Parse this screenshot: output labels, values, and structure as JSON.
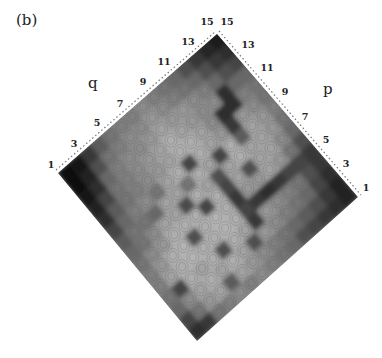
{
  "panel_label": "(b)",
  "chart_data": {
    "type": "heatmap",
    "title": "",
    "panel": "(b)",
    "orientation": "rotated 45 degrees (diamond)",
    "xlabel": "q",
    "ylabel": "p",
    "q_ticks": [
      "1",
      "3",
      "5",
      "7",
      "9",
      "11",
      "13",
      "15"
    ],
    "p_ticks": [
      "1",
      "3",
      "5",
      "7",
      "9",
      "11",
      "13",
      "15"
    ],
    "q_range": [
      1,
      15
    ],
    "p_range": [
      1,
      15
    ],
    "colormap": "grayscale (dark = high)",
    "grid": false,
    "legend": "none",
    "rows_are_p_from_1_to_15_columns_are_q_from_1_to_15": true,
    "values": [
      [
        0.85,
        0.8,
        0.55,
        0.5,
        0.45,
        0.5,
        0.45,
        0.5,
        0.55,
        0.6,
        0.7,
        0.75,
        0.8,
        0.85,
        0.9
      ],
      [
        0.75,
        0.55,
        0.4,
        0.35,
        0.65,
        0.35,
        0.4,
        0.45,
        0.5,
        0.55,
        0.6,
        0.65,
        0.7,
        0.8,
        0.9
      ],
      [
        0.6,
        0.45,
        0.35,
        0.3,
        0.35,
        0.3,
        0.35,
        0.7,
        0.4,
        0.45,
        0.5,
        0.55,
        0.6,
        0.75,
        0.85
      ],
      [
        0.55,
        0.75,
        0.3,
        0.35,
        0.3,
        0.7,
        0.3,
        0.35,
        0.8,
        0.4,
        0.45,
        0.5,
        0.55,
        0.7,
        0.8
      ],
      [
        0.5,
        0.35,
        0.3,
        0.28,
        0.3,
        0.3,
        0.28,
        0.3,
        0.75,
        0.8,
        0.85,
        0.8,
        0.75,
        0.75,
        0.8
      ],
      [
        0.5,
        0.4,
        0.3,
        0.28,
        0.7,
        0.3,
        0.28,
        0.3,
        0.8,
        0.4,
        0.4,
        0.35,
        0.4,
        0.55,
        0.7
      ],
      [
        0.55,
        0.45,
        0.4,
        0.3,
        0.3,
        0.3,
        0.75,
        0.3,
        0.75,
        0.35,
        0.7,
        0.35,
        0.35,
        0.45,
        0.6
      ],
      [
        0.6,
        0.55,
        0.45,
        0.35,
        0.35,
        0.72,
        0.3,
        0.35,
        0.7,
        0.35,
        0.3,
        0.35,
        0.35,
        0.4,
        0.55
      ],
      [
        0.65,
        0.55,
        0.55,
        0.6,
        0.35,
        0.35,
        0.55,
        0.3,
        0.35,
        0.75,
        0.3,
        0.65,
        0.35,
        0.4,
        0.5
      ],
      [
        0.75,
        0.6,
        0.5,
        0.45,
        0.55,
        0.35,
        0.3,
        0.75,
        0.3,
        0.35,
        0.4,
        0.8,
        0.4,
        0.45,
        0.55
      ],
      [
        0.85,
        0.65,
        0.55,
        0.5,
        0.45,
        0.4,
        0.35,
        0.3,
        0.3,
        0.35,
        0.45,
        0.85,
        0.85,
        0.5,
        0.55
      ],
      [
        0.9,
        0.75,
        0.55,
        0.5,
        0.45,
        0.4,
        0.35,
        0.3,
        0.35,
        0.4,
        0.45,
        0.45,
        0.85,
        0.6,
        0.6
      ],
      [
        0.95,
        0.85,
        0.6,
        0.5,
        0.45,
        0.45,
        0.4,
        0.35,
        0.4,
        0.4,
        0.45,
        0.5,
        0.6,
        0.7,
        0.75
      ],
      [
        0.97,
        0.9,
        0.7,
        0.55,
        0.5,
        0.45,
        0.45,
        0.4,
        0.45,
        0.5,
        0.55,
        0.6,
        0.7,
        0.8,
        0.85
      ],
      [
        0.98,
        0.95,
        0.8,
        0.65,
        0.55,
        0.5,
        0.5,
        0.45,
        0.5,
        0.55,
        0.6,
        0.7,
        0.8,
        0.88,
        0.92
      ]
    ],
    "annotations": [
      "q",
      "p"
    ]
  },
  "axes": {
    "q_label": "q",
    "p_label": "p"
  }
}
